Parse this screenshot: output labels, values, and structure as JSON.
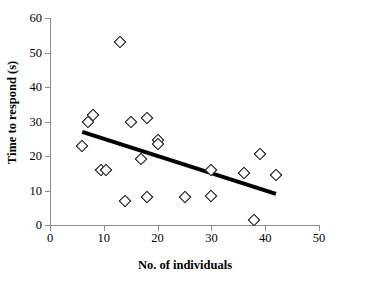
{
  "chart_data": {
    "type": "scatter",
    "title": "",
    "xlabel": "No. of individuals",
    "ylabel": "Time to respond (s)",
    "xlim": [
      0,
      50
    ],
    "ylim": [
      0,
      60
    ],
    "xticks": [
      0,
      10,
      20,
      30,
      40,
      50
    ],
    "yticks": [
      0,
      10,
      20,
      30,
      40,
      50,
      60
    ],
    "grid": false,
    "legend": null,
    "marker": "open-diamond",
    "points": [
      {
        "x": 6,
        "y": 23
      },
      {
        "x": 7,
        "y": 30
      },
      {
        "x": 8,
        "y": 32
      },
      {
        "x": 9.5,
        "y": 16
      },
      {
        "x": 10.5,
        "y": 16
      },
      {
        "x": 13,
        "y": 53
      },
      {
        "x": 14,
        "y": 7
      },
      {
        "x": 15,
        "y": 30
      },
      {
        "x": 17,
        "y": 19
      },
      {
        "x": 18,
        "y": 31
      },
      {
        "x": 18,
        "y": 8
      },
      {
        "x": 20,
        "y": 24.5
      },
      {
        "x": 20,
        "y": 23.5
      },
      {
        "x": 25,
        "y": 8
      },
      {
        "x": 30,
        "y": 16
      },
      {
        "x": 30,
        "y": 8.5
      },
      {
        "x": 36,
        "y": 15
      },
      {
        "x": 38,
        "y": 1.5
      },
      {
        "x": 39,
        "y": 20.5
      },
      {
        "x": 42,
        "y": 14.5
      }
    ],
    "trendline": {
      "type": "linear",
      "x_start": 6,
      "y_start": 27,
      "x_end": 42,
      "y_end": 9
    }
  },
  "axis": {
    "x_tick_labels": [
      "0",
      "10",
      "20",
      "30",
      "40",
      "50"
    ],
    "y_tick_labels": [
      "0",
      "10",
      "20",
      "30",
      "40",
      "50",
      "60"
    ]
  },
  "colors": {
    "marker_stroke": "#000000",
    "marker_fill": "#ffffff",
    "trendline": "#000000",
    "axis": "#8c8c8c",
    "background": "#ffffff"
  }
}
